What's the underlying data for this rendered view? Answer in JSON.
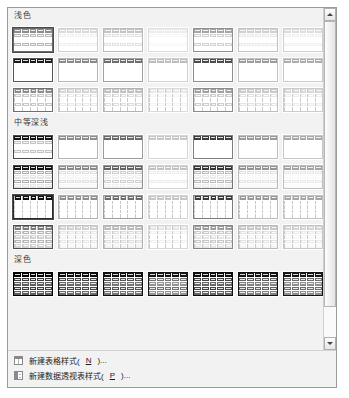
{
  "gallery": {
    "name": "table-styles-gallery",
    "sections": [
      {
        "id": "light",
        "heading": "浅色",
        "rows": [
          {
            "style": "plain",
            "swatches": [
              {
                "selected": true,
                "header": "#8c8c8c",
                "bandA": "#b8b8b8",
                "bandB": "#ffffff",
                "border": "#6b6b6b"
              },
              {
                "selected": false,
                "header": "#d9d9d9",
                "bandA": "#efefef",
                "bandB": "#ffffff",
                "border": "#cfcfcf"
              },
              {
                "selected": false,
                "header": "#c4c4c4",
                "bandA": "#e2e2e2",
                "bandB": "#ffffff",
                "border": "#b9b9b9"
              },
              {
                "selected": false,
                "header": "#ebebeb",
                "bandA": "#f7f7f7",
                "bandB": "#ffffff",
                "border": "#dedede"
              },
              {
                "selected": false,
                "header": "#a6a6a6",
                "bandA": "#d2d2d2",
                "bandB": "#ffffff",
                "border": "#8f8f8f"
              },
              {
                "selected": false,
                "header": "#cfcfcf",
                "bandA": "#e9e9e9",
                "bandB": "#ffffff",
                "border": "#c2c2c2"
              },
              {
                "selected": false,
                "header": "#dcdcdc",
                "bandA": "#f0f0f0",
                "bandB": "#ffffff",
                "border": "#d0d0d0"
              }
            ]
          },
          {
            "style": "plain",
            "swatches": [
              {
                "selected": false,
                "header": "#1a1a1a",
                "bandA": "#ffffff",
                "bandB": "#ffffff",
                "border": "#555555"
              },
              {
                "selected": false,
                "header": "#8a8a8a",
                "bandA": "#ffffff",
                "bandB": "#ffffff",
                "border": "#b5b5b5"
              },
              {
                "selected": false,
                "header": "#6f6f6f",
                "bandA": "#ffffff",
                "bandB": "#ffffff",
                "border": "#a0a0a0"
              },
              {
                "selected": false,
                "header": "#bdbdbd",
                "bandA": "#ffffff",
                "bandB": "#ffffff",
                "border": "#d0d0d0"
              },
              {
                "selected": false,
                "header": "#4d4d4d",
                "bandA": "#ffffff",
                "bandB": "#ffffff",
                "border": "#8d8d8d"
              },
              {
                "selected": false,
                "header": "#9c9c9c",
                "bandA": "#ffffff",
                "bandB": "#ffffff",
                "border": "#c0c0c0"
              },
              {
                "selected": false,
                "header": "#adadad",
                "bandA": "#ffffff",
                "bandB": "#ffffff",
                "border": "#c9c9c9"
              }
            ]
          },
          {
            "style": "cols",
            "swatches": [
              {
                "selected": false,
                "header": "#8c8c8c",
                "bandA": "#c9c9c9",
                "bandB": "#ffffff",
                "border": "#6f6f6f"
              },
              {
                "selected": false,
                "header": "#d6d6d6",
                "bandA": "#ededed",
                "bandB": "#ffffff",
                "border": "#c8c8c8"
              },
              {
                "selected": false,
                "header": "#c0c0c0",
                "bandA": "#e0e0e0",
                "bandB": "#ffffff",
                "border": "#b4b4b4"
              },
              {
                "selected": false,
                "header": "#e8e8e8",
                "bandA": "#f5f5f5",
                "bandB": "#ffffff",
                "border": "#dadada"
              },
              {
                "selected": false,
                "header": "#a2a2a2",
                "bandA": "#cfcfcf",
                "bandB": "#ffffff",
                "border": "#8b8b8b"
              },
              {
                "selected": false,
                "header": "#cbcbcb",
                "bandA": "#e6e6e6",
                "bandB": "#ffffff",
                "border": "#bebebe"
              },
              {
                "selected": false,
                "header": "#d8d8d8",
                "bandA": "#eeeeee",
                "bandB": "#ffffff",
                "border": "#cccccc"
              }
            ]
          }
        ]
      },
      {
        "id": "medium",
        "heading": "中等深浅",
        "rows": [
          {
            "style": "plain",
            "swatches": [
              {
                "selected": false,
                "header": "#141414",
                "bandA": "#c4c4c4",
                "bandB": "#ffffff",
                "border": "#4a4a4a"
              },
              {
                "selected": false,
                "header": "#8f8f8f",
                "bandA": "#ffffff",
                "bandB": "#ffffff",
                "border": "#b3b3b3"
              },
              {
                "selected": false,
                "header": "#6a6a6a",
                "bandA": "#ffffff",
                "bandB": "#ffffff",
                "border": "#9b9b9b"
              },
              {
                "selected": false,
                "header": "#c7c7c7",
                "bandA": "#ffffff",
                "bandB": "#ffffff",
                "border": "#d5d5d5"
              },
              {
                "selected": false,
                "header": "#3d3d3d",
                "bandA": "#ffffff",
                "bandB": "#ffffff",
                "border": "#7d7d7d"
              },
              {
                "selected": false,
                "header": "#9a9a9a",
                "bandA": "#ffffff",
                "bandB": "#ffffff",
                "border": "#bebebe"
              },
              {
                "selected": false,
                "header": "#a8a8a8",
                "bandA": "#ffffff",
                "bandB": "#ffffff",
                "border": "#c5c5c5"
              }
            ]
          },
          {
            "style": "plain",
            "swatches": [
              {
                "selected": false,
                "header": "#121212",
                "bandA": "#b0b0b0",
                "bandB": "#e6e6e6",
                "border": "#3f3f3f"
              },
              {
                "selected": false,
                "header": "#8b8b8b",
                "bandA": "#dedede",
                "bandB": "#f6f6f6",
                "border": "#adadad"
              },
              {
                "selected": false,
                "header": "#646464",
                "bandA": "#cfcfcf",
                "bandB": "#f0f0f0",
                "border": "#949494"
              },
              {
                "selected": false,
                "header": "#c2c2c2",
                "bandA": "#ededed",
                "bandB": "#ffffff",
                "border": "#d2d2d2"
              },
              {
                "selected": false,
                "header": "#373737",
                "bandA": "#bdbdbd",
                "bandB": "#ececec",
                "border": "#757575"
              },
              {
                "selected": false,
                "header": "#949494",
                "bandA": "#e2e2e2",
                "bandB": "#f8f8f8",
                "border": "#b8b8b8"
              },
              {
                "selected": false,
                "header": "#a3a3a3",
                "bandA": "#e8e8e8",
                "bandB": "#fafafa",
                "border": "#c0c0c0"
              }
            ]
          },
          {
            "style": "cols",
            "swatches": [
              {
                "selected": true,
                "header": "#0f0f0f",
                "bandA": "#ffffff",
                "bandB": "#ffffff",
                "border": "#2b2b2b"
              },
              {
                "selected": false,
                "header": "#8f8f8f",
                "bandA": "#ffffff",
                "bandB": "#ffffff",
                "border": "#b1b1b1"
              },
              {
                "selected": false,
                "header": "#6c6c6c",
                "bandA": "#ffffff",
                "bandB": "#ffffff",
                "border": "#9c9c9c"
              },
              {
                "selected": false,
                "header": "#c6c6c6",
                "bandA": "#ffffff",
                "bandB": "#ffffff",
                "border": "#d4d4d4"
              },
              {
                "selected": false,
                "header": "#3b3b3b",
                "bandA": "#ffffff",
                "bandB": "#ffffff",
                "border": "#7b7b7b"
              },
              {
                "selected": false,
                "header": "#989898",
                "bandA": "#ffffff",
                "bandB": "#ffffff",
                "border": "#bcbcbc"
              },
              {
                "selected": false,
                "header": "#a6a6a6",
                "bandA": "#ffffff",
                "bandB": "#ffffff",
                "border": "#c3c3c3"
              }
            ]
          },
          {
            "style": "cols",
            "swatches": [
              {
                "selected": false,
                "header": "#7b7b7b",
                "bandA": "#b6b6b6",
                "bandB": "#d4d4d4",
                "border": "#4f4f4f"
              },
              {
                "selected": false,
                "header": "#d2d2d2",
                "bandA": "#e8e8e8",
                "bandB": "#f6f6f6",
                "border": "#c4c4c4"
              },
              {
                "selected": false,
                "header": "#bcbcbc",
                "bandA": "#dddddd",
                "bandB": "#f0f0f0",
                "border": "#b0b0b0"
              },
              {
                "selected": false,
                "header": "#e4e4e4",
                "bandA": "#f2f2f2",
                "bandB": "#ffffff",
                "border": "#d6d6d6"
              },
              {
                "selected": false,
                "header": "#9d9d9d",
                "bandA": "#cacaca",
                "bandB": "#e6e6e6",
                "border": "#868686"
              },
              {
                "selected": false,
                "header": "#c8c8c8",
                "bandA": "#e2e2e2",
                "bandB": "#f4f4f4",
                "border": "#bababa"
              },
              {
                "selected": false,
                "header": "#d4d4d4",
                "bandA": "#eaeaea",
                "bandB": "#f8f8f8",
                "border": "#c8c8c8"
              }
            ]
          }
        ]
      },
      {
        "id": "dark",
        "heading": "深色",
        "rows": [
          {
            "style": "plain",
            "swatches": [
              {
                "selected": false,
                "header": "#000000",
                "bandA": "#3c3c3c",
                "bandB": "#5e5e5e",
                "border": "#000000"
              },
              {
                "selected": false,
                "header": "#0a0a0a",
                "bandA": "#484848",
                "bandB": "#6a6a6a",
                "border": "#0a0a0a"
              },
              {
                "selected": false,
                "header": "#101010",
                "bandA": "#555555",
                "bandB": "#777777",
                "border": "#101010"
              },
              {
                "selected": false,
                "header": "#141414",
                "bandA": "#737373",
                "bandB": "#949494",
                "border": "#141414"
              },
              {
                "selected": false,
                "header": "#0d0d0d",
                "bandA": "#444444",
                "bandB": "#676767",
                "border": "#0d0d0d"
              },
              {
                "selected": false,
                "header": "#121212",
                "bandA": "#616161",
                "bandB": "#828282",
                "border": "#121212"
              },
              {
                "selected": false,
                "header": "#161616",
                "bandA": "#6e6e6e",
                "bandB": "#8f8f8f",
                "border": "#161616"
              }
            ]
          }
        ]
      }
    ]
  },
  "scrollbar": {
    "up_arrow": "scroll-up-arrow",
    "down_arrow": "scroll-down-arrow"
  },
  "commands": [
    {
      "icon": "table",
      "label": "新建表格样式",
      "accel": "N",
      "suffix": "..."
    },
    {
      "icon": "pivot",
      "label": "新建数据透视表样式",
      "accel": "P",
      "suffix": "..."
    }
  ]
}
